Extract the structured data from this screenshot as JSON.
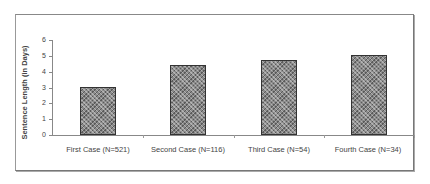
{
  "chart_data": {
    "type": "bar",
    "title": "",
    "xlabel": "",
    "ylabel": "Sentence Length (in Days)",
    "categories": [
      "First Case (N=521)",
      "Second Case (N=116)",
      "Third Case (N=54)",
      "Fourth Case (N=34)"
    ],
    "values": [
      3.0,
      4.45,
      4.75,
      5.05
    ],
    "ylim": [
      0,
      6
    ],
    "yticks": [
      "0",
      "1",
      "2",
      "3",
      "4",
      "5",
      "6"
    ],
    "grid": false,
    "legend": null,
    "bar_fill": "crosshatch gray",
    "colors": {
      "bar": "#8a8a8a",
      "bar_border": "#333333",
      "axis": "#888888"
    }
  }
}
